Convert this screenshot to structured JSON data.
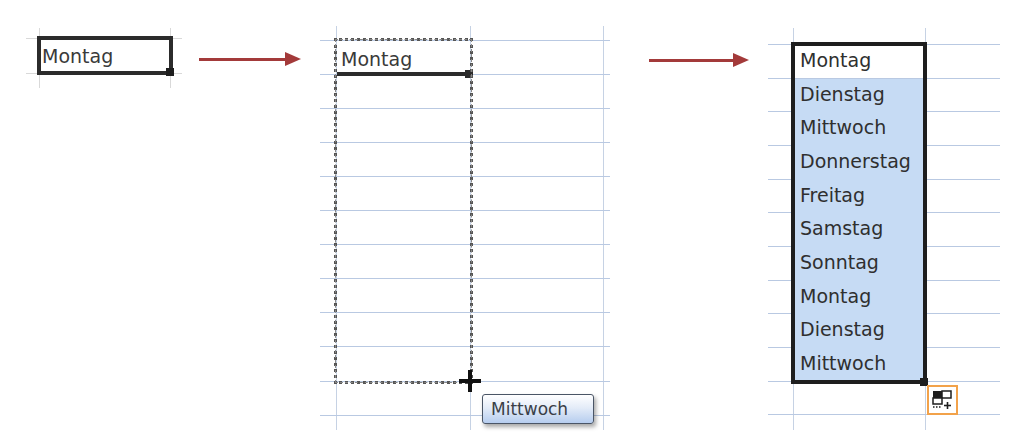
{
  "panel1": {
    "cell_value": "Montag"
  },
  "panel2": {
    "cell_value": "Montag",
    "drag_tooltip": "Mittwoch"
  },
  "panel3": {
    "cells": [
      {
        "value": "Montag",
        "selected_fill": false
      },
      {
        "value": "Dienstag",
        "selected_fill": true
      },
      {
        "value": "Mittwoch",
        "selected_fill": true
      },
      {
        "value": "Donnerstag",
        "selected_fill": true
      },
      {
        "value": "Freitag",
        "selected_fill": true
      },
      {
        "value": "Samstag",
        "selected_fill": true
      },
      {
        "value": "Sonntag",
        "selected_fill": true
      },
      {
        "value": "Montag",
        "selected_fill": true
      },
      {
        "value": "Dienstag",
        "selected_fill": true
      },
      {
        "value": "Mittwoch",
        "selected_fill": true
      }
    ],
    "autofill_options_icon": "autofill-options-icon"
  },
  "colors": {
    "arrow": "#a33a3a",
    "selection_fill": "#c6dbf4",
    "gridline": "#b9c9e2",
    "autofill_border": "#f2a24a"
  }
}
